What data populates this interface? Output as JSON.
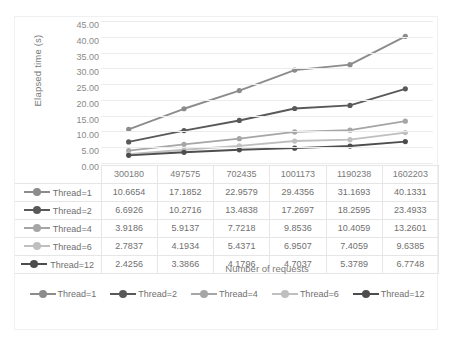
{
  "chart_data": {
    "type": "line",
    "title": "",
    "xlabel": "Number of requests",
    "ylabel": "Elapsed time (s)",
    "categories": [
      "300180",
      "497575",
      "702435",
      "1001173",
      "1190238",
      "1602203"
    ],
    "ylim": [
      0,
      45
    ],
    "ytick_step": 5,
    "ytick_labels": [
      "45.00",
      "40.00",
      "35.00",
      "30.00",
      "25.00",
      "20.00",
      "15.00",
      "10.00",
      "5.00",
      "0.00"
    ],
    "grid": "horizontal",
    "legend_position": "bottom",
    "marker": "circle",
    "series": [
      {
        "name": "Thread=1",
        "color": "#8c8c8c",
        "values": [
          10.6654,
          17.1852,
          22.9579,
          29.4356,
          31.1693,
          40.1331
        ]
      },
      {
        "name": "Thread=2",
        "color": "#595959",
        "values": [
          6.6926,
          10.2716,
          13.4838,
          17.2697,
          18.2595,
          23.4933
        ]
      },
      {
        "name": "Thread=4",
        "color": "#a6a6a6",
        "values": [
          3.9186,
          5.9137,
          7.7218,
          9.8536,
          10.4059,
          13.2601
        ]
      },
      {
        "name": "Thread=6",
        "color": "#bfbfbf",
        "values": [
          2.7837,
          4.1934,
          5.4371,
          6.9507,
          7.4059,
          9.6385
        ]
      },
      {
        "name": "Thread=12",
        "color": "#4d4d4d",
        "values": [
          2.4256,
          3.3866,
          4.1796,
          4.7037,
          5.3789,
          6.7748
        ]
      }
    ]
  },
  "table": {
    "corner_label": "",
    "column_headers": [
      "300180",
      "497575",
      "702435",
      "1001173",
      "1190238",
      "1602203"
    ],
    "rows": [
      {
        "label": "Thread=1",
        "cells": [
          "10.6654",
          "17.1852",
          "22.9579",
          "29.4356",
          "31.1693",
          "40.1331"
        ]
      },
      {
        "label": "Thread=2",
        "cells": [
          "6.6926",
          "10.2716",
          "13.4838",
          "17.2697",
          "18.2595",
          "23.4933"
        ]
      },
      {
        "label": "Thread=4",
        "cells": [
          "3.9186",
          "5.9137",
          "7.7218",
          "9.8536",
          "10.4059",
          "13.2601"
        ]
      },
      {
        "label": "Thread=6",
        "cells": [
          "2.7837",
          "4.1934",
          "5.4371",
          "6.9507",
          "7.4059",
          "9.6385"
        ]
      },
      {
        "label": "Thread=12",
        "cells": [
          "2.4256",
          "3.3866",
          "4.1796",
          "4.7037",
          "5.3789",
          "6.7748"
        ]
      }
    ]
  },
  "legend": {
    "items": [
      "Thread=1",
      "Thread=2",
      "Thread=4",
      "Thread=6",
      "Thread=12"
    ]
  }
}
